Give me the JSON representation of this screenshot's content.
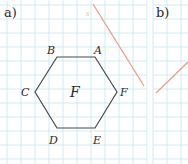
{
  "panels": [
    {
      "label": "a)"
    },
    {
      "label": "b)"
    }
  ],
  "figure": {
    "name": "F",
    "vertices": [
      {
        "label": "A"
      },
      {
        "label": "B"
      },
      {
        "label": "C"
      },
      {
        "label": "D"
      },
      {
        "label": "E"
      },
      {
        "label": "F"
      }
    ],
    "line_label": "s"
  },
  "colors": {
    "grid": "#bfe3ee",
    "hexagon": "#4a4a4a",
    "line": "#e8a088",
    "text": "#2a2a2a"
  }
}
